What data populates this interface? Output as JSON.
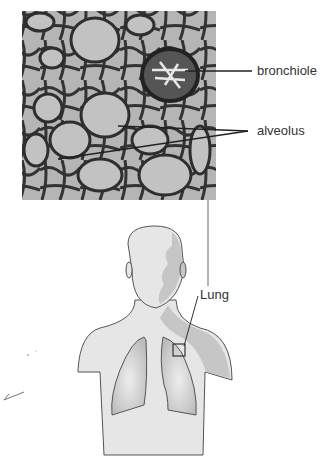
{
  "figure": {
    "micrograph": {
      "description": "lung tissue micrograph",
      "labels": {
        "bronchiole": "bronchiole",
        "alveolus": "alveolus"
      }
    },
    "body_diagram": {
      "description": "human upper body with lungs",
      "labels": {
        "lung": "Lung"
      }
    },
    "colors": {
      "tissue_dark": "#3a3a3a",
      "tissue_light": "#b8b8b8",
      "skin": "#e6e6e6",
      "skin_shadow": "#c6c6c6",
      "lung_fill": "#cfcfcf",
      "outline": "#555555"
    }
  }
}
